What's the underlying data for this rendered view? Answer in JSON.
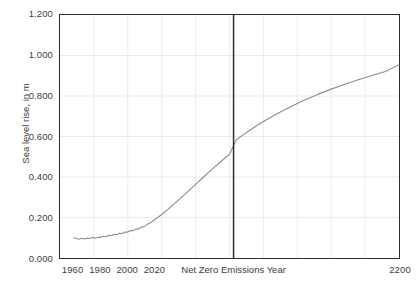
{
  "chart_data": {
    "type": "line",
    "title": "",
    "xlabel": "Net Zero Emissions Year",
    "ylabel": "Sea level rise, in m",
    "xlim": [
      1950,
      2200
    ],
    "ylim": [
      0.0,
      1.2
    ],
    "grid": true,
    "legend": null,
    "x_ticks": [
      {
        "value": 1960,
        "label": "1960"
      },
      {
        "value": 1980,
        "label": "1980"
      },
      {
        "value": 2000,
        "label": "2000"
      },
      {
        "value": 2020,
        "label": "2020"
      },
      {
        "value": 2200,
        "label": "2200"
      }
    ],
    "y_ticks": [
      {
        "value": 0.0,
        "label": "0.000"
      },
      {
        "value": 0.2,
        "label": "0.200"
      },
      {
        "value": 0.4,
        "label": "0.400"
      },
      {
        "value": 0.6,
        "label": "0.600"
      },
      {
        "value": 0.8,
        "label": "0.800"
      },
      {
        "value": 1.0,
        "label": "1.000"
      },
      {
        "value": 1.2,
        "label": "1.200"
      }
    ],
    "x_gridlines": [
      1975,
      2000,
      2025,
      2050,
      2075,
      2100,
      2125,
      2150,
      2175
    ],
    "y_gridlines": [
      0.2,
      0.4,
      0.6,
      0.8,
      1.0
    ],
    "annotations": [
      {
        "name": "net-zero-emissions-year-line",
        "type": "vline",
        "x": 2078,
        "label": "Net Zero Emissions Year",
        "color": "#2b2b2b"
      }
    ],
    "series": [
      {
        "name": "Sea level rise",
        "color": "#8c8c8c",
        "x": [
          1960,
          1962,
          1964,
          1966,
          1968,
          1970,
          1972,
          1974,
          1976,
          1978,
          1980,
          1982,
          1984,
          1986,
          1988,
          1990,
          1992,
          1994,
          1996,
          1998,
          2000,
          2002,
          2004,
          2006,
          2008,
          2010,
          2012,
          2014,
          2016,
          2018,
          2020,
          2025,
          2030,
          2035,
          2040,
          2045,
          2050,
          2055,
          2060,
          2065,
          2070,
          2075,
          2080,
          2085,
          2090,
          2095,
          2100,
          2110,
          2120,
          2130,
          2140,
          2150,
          2160,
          2170,
          2180,
          2190,
          2200
        ],
        "y": [
          0.1,
          0.096,
          0.093,
          0.098,
          0.094,
          0.099,
          0.096,
          0.101,
          0.098,
          0.103,
          0.101,
          0.107,
          0.105,
          0.112,
          0.11,
          0.117,
          0.115,
          0.122,
          0.121,
          0.128,
          0.128,
          0.136,
          0.135,
          0.144,
          0.143,
          0.153,
          0.155,
          0.165,
          0.172,
          0.18,
          0.19,
          0.215,
          0.243,
          0.272,
          0.302,
          0.333,
          0.364,
          0.395,
          0.425,
          0.455,
          0.484,
          0.512,
          0.584,
          0.608,
          0.631,
          0.653,
          0.674,
          0.712,
          0.747,
          0.779,
          0.808,
          0.834,
          0.858,
          0.88,
          0.901,
          0.921,
          0.955
        ]
      }
    ]
  },
  "figure": {
    "background": "#ffffff",
    "frame_color": "#2b2b2b",
    "grid_color": "#ebebeb",
    "text_color": "#3d3d3d"
  }
}
